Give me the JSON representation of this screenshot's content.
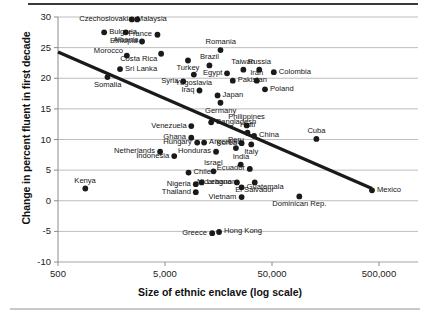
{
  "chart_data": {
    "type": "scatter",
    "title": "",
    "xlabel": "Size of ethnic enclave (log scale)",
    "ylabel": "Change in percent fluent in first decade",
    "xscale": "log",
    "xlim": [
      500,
      1200000
    ],
    "ylim": [
      -10,
      30
    ],
    "xticks": [
      500,
      5000,
      50000,
      500000
    ],
    "xticklabels": [
      "500",
      "5,000",
      "50,000",
      "500,000"
    ],
    "yticks": [
      -10,
      -5,
      0,
      5,
      10,
      15,
      20,
      25,
      30
    ],
    "yticklabels": [
      "-10",
      "-5",
      "0",
      "5",
      "10",
      "15",
      "20",
      "25",
      "30"
    ],
    "grid": "horizontal",
    "legend": "none",
    "marker_color": "#1a1a1a",
    "trendline_color": "#1a1a1a",
    "trendline": {
      "label": "linear fit",
      "x_start": 500,
      "y_start": 24.3,
      "x_end": 430000,
      "y_end": 2.0
    },
    "points": [
      {
        "label": "Malaysia",
        "x": 2450,
        "y": 29.6,
        "lx": "right"
      },
      {
        "label": "Czechoslovakia",
        "x": 2750,
        "y": 29.6,
        "lx": "left"
      },
      {
        "label": "Bulgaria",
        "x": 1350,
        "y": 27.5,
        "lx": "right"
      },
      {
        "label": "Albania",
        "x": 2150,
        "y": 27.5,
        "lx": "below"
      },
      {
        "label": "Ethiopia",
        "x": 3050,
        "y": 26.0,
        "lx": "left"
      },
      {
        "label": "France",
        "x": 4250,
        "y": 27.1,
        "lx": "left"
      },
      {
        "label": "Romania",
        "x": 16500,
        "y": 24.6,
        "lx": "above"
      },
      {
        "label": "Morocco",
        "x": 2200,
        "y": 23.7,
        "lx": "left-above"
      },
      {
        "label": "Costa Rica",
        "x": 4600,
        "y": 24.0,
        "lx": "left-below"
      },
      {
        "label": "Brazil",
        "x": 13000,
        "y": 22.1,
        "lx": "above"
      },
      {
        "label": "Taiwan",
        "x": 27000,
        "y": 21.4,
        "lx": "above"
      },
      {
        "label": "Russia",
        "x": 38000,
        "y": 21.4,
        "lx": "above"
      },
      {
        "label": "Colombia",
        "x": 52000,
        "y": 21.0,
        "lx": "right"
      },
      {
        "label": "Sri Lanka",
        "x": 1900,
        "y": 21.5,
        "lx": "right"
      },
      {
        "label": "Turkey",
        "x": 8200,
        "y": 22.9,
        "lx": "below"
      },
      {
        "label": "Yugoslavia",
        "x": 9300,
        "y": 20.6,
        "lx": "below"
      },
      {
        "label": "Egypt",
        "x": 19000,
        "y": 20.8,
        "lx": "left"
      },
      {
        "label": "Pakistan",
        "x": 21500,
        "y": 19.6,
        "lx": "right"
      },
      {
        "label": "Iran",
        "x": 36000,
        "y": 19.6,
        "lx": "above"
      },
      {
        "label": "Poland",
        "x": 43000,
        "y": 18.2,
        "lx": "right"
      },
      {
        "label": "Somalia",
        "x": 1450,
        "y": 20.2,
        "lx": "below"
      },
      {
        "label": "Syria",
        "x": 7400,
        "y": 19.5,
        "lx": "left"
      },
      {
        "label": "Iraq",
        "x": 10500,
        "y": 18.0,
        "lx": "left"
      },
      {
        "label": "Japan",
        "x": 15500,
        "y": 17.2,
        "lx": "right"
      },
      {
        "label": "Germany",
        "x": 16500,
        "y": 16.0,
        "lx": "below"
      },
      {
        "label": "Venezuela",
        "x": 8800,
        "y": 12.2,
        "lx": "left"
      },
      {
        "label": "Bangladesh",
        "x": 13500,
        "y": 12.8,
        "lx": "right"
      },
      {
        "label": "Philippines",
        "x": 29000,
        "y": 12.3,
        "lx": "above"
      },
      {
        "label": "Haiti",
        "x": 29500,
        "y": 11.1,
        "lx": "above"
      },
      {
        "label": "China",
        "x": 34000,
        "y": 10.6,
        "lx": "right"
      },
      {
        "label": "Cuba",
        "x": 130000,
        "y": 10.1,
        "lx": "above"
      },
      {
        "label": "Ghana",
        "x": 8800,
        "y": 10.3,
        "lx": "left"
      },
      {
        "label": "Hungary",
        "x": 10000,
        "y": 9.5,
        "lx": "left"
      },
      {
        "label": "Argentina",
        "x": 11600,
        "y": 9.5,
        "lx": "right"
      },
      {
        "label": "Korea",
        "x": 26000,
        "y": 9.4,
        "lx": "left"
      },
      {
        "label": "Italy",
        "x": 32000,
        "y": 9.2,
        "lx": "below"
      },
      {
        "label": "Netherlands",
        "x": 4500,
        "y": 8.0,
        "lx": "left"
      },
      {
        "label": "Indonesia",
        "x": 6100,
        "y": 7.3,
        "lx": "left"
      },
      {
        "label": "Honduras",
        "x": 15000,
        "y": 8.0,
        "lx": "left"
      },
      {
        "label": "Peru",
        "x": 23000,
        "y": 8.6,
        "lx": "above"
      },
      {
        "label": "Israel",
        "x": 14200,
        "y": 4.8,
        "lx": "above"
      },
      {
        "label": "India",
        "x": 25500,
        "y": 5.9,
        "lx": "above"
      },
      {
        "label": "Ecuador",
        "x": 31000,
        "y": 5.2,
        "lx": "left"
      },
      {
        "label": "Chile",
        "x": 8300,
        "y": 4.6,
        "lx": "right"
      },
      {
        "label": "Nigeria",
        "x": 9700,
        "y": 2.7,
        "lx": "left"
      },
      {
        "label": "Lebanon",
        "x": 11000,
        "y": 3.0,
        "lx": "right"
      },
      {
        "label": "Nicaragua",
        "x": 23500,
        "y": 3.0,
        "lx": "left"
      },
      {
        "label": "Guatemala",
        "x": 26000,
        "y": 2.2,
        "lx": "right"
      },
      {
        "label": "El Salvador",
        "x": 34500,
        "y": 3.0,
        "lx": "below"
      },
      {
        "label": "Thailand",
        "x": 9700,
        "y": 1.4,
        "lx": "left"
      },
      {
        "label": "Vietnam",
        "x": 26000,
        "y": 0.6,
        "lx": "left"
      },
      {
        "label": "Mexico",
        "x": 430000,
        "y": 1.7,
        "lx": "right"
      },
      {
        "label": "Dominican Rep.",
        "x": 90000,
        "y": 0.7,
        "lx": "below"
      },
      {
        "label": "Kenya",
        "x": 900,
        "y": 2.0,
        "lx": "above"
      },
      {
        "label": "Greece",
        "x": 13800,
        "y": -5.3,
        "lx": "left"
      },
      {
        "label": "Hong Kong",
        "x": 16000,
        "y": -5.1,
        "lx": "right"
      }
    ]
  }
}
